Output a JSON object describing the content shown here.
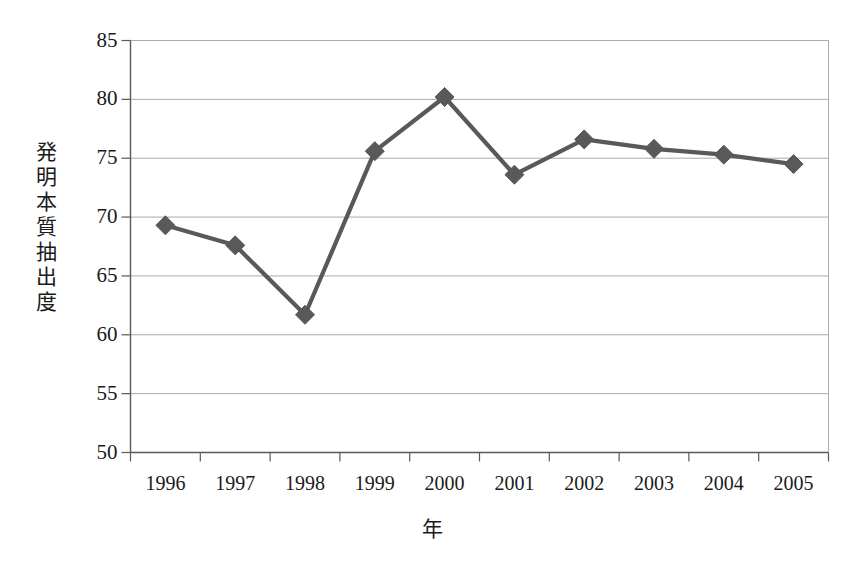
{
  "chart_data": {
    "type": "line",
    "title": "",
    "xlabel": "年",
    "ylabel": "発明本質抽出度",
    "categories": [
      "1996",
      "1997",
      "1998",
      "1999",
      "2000",
      "2001",
      "2002",
      "2003",
      "2004",
      "2005"
    ],
    "values": [
      69.3,
      67.6,
      61.7,
      75.6,
      80.2,
      73.6,
      76.6,
      75.8,
      75.3,
      74.5
    ],
    "series": [
      {
        "name": "発明本質抽出度",
        "values": [
          69.3,
          67.6,
          61.7,
          75.6,
          80.2,
          73.6,
          76.6,
          75.8,
          75.3,
          74.5
        ]
      }
    ],
    "ylim": [
      50,
      85
    ],
    "ytick_labels": [
      "50",
      "55",
      "60",
      "65",
      "70",
      "75",
      "80",
      "85"
    ],
    "ytick_values": [
      50,
      55,
      60,
      65,
      70,
      75,
      80,
      85
    ],
    "ytick_step": 5,
    "grid": "horizontal",
    "legend": "none",
    "marker": "diamond",
    "line_color": "#595959",
    "marker_color": "#595959",
    "grid_color": "#aaaaaa",
    "axis_color": "#808080",
    "text_color": "#1a1a1a",
    "background": "#ffffff"
  }
}
